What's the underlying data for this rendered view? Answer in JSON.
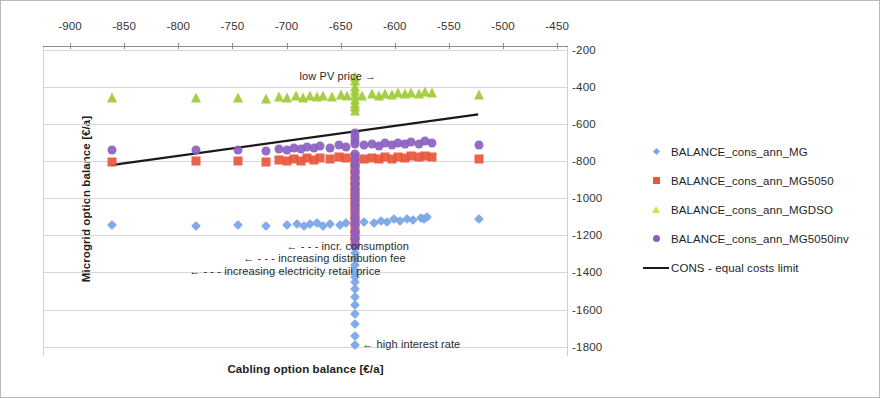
{
  "chart_data": {
    "type": "scatter",
    "title": "",
    "xlabel": "Cabling option balance [€/a]",
    "ylabel": "Microgrid option balance [€/a]",
    "xlim": [
      -925,
      -440
    ],
    "ylim": [
      -1850,
      -180
    ],
    "x_ticks": [
      -900,
      -850,
      -800,
      -750,
      -700,
      -650,
      -600,
      -550,
      -500,
      -450
    ],
    "y_ticks": [
      -200,
      -400,
      -600,
      -800,
      -1000,
      -1200,
      -1400,
      -1600,
      -1800
    ],
    "x_axis_position": "top",
    "y_axis_position": "right",
    "grid": true,
    "legend_position": "right",
    "colors": {
      "BALANCE_cons_ann_MG": "#7ca6e8",
      "BALANCE_cons_ann_MG5050": "#e8563c",
      "BALANCE_cons_ann_MGDSO": "#9ecb36",
      "BALANCE_cons_ann_MG5050inv": "#8b5fbf",
      "CONS - equal costs limit": "#1a1a1a"
    },
    "series": [
      {
        "name": "BALANCE_cons_ann_MG",
        "marker": "diamond",
        "color": "#7ca6e8",
        "points": [
          [
            -861,
            -1146
          ],
          [
            -784,
            -1147
          ],
          [
            -745,
            -1146
          ],
          [
            -719,
            -1150
          ],
          [
            -700,
            -1142
          ],
          [
            -690,
            -1137
          ],
          [
            -684,
            -1150
          ],
          [
            -678,
            -1140
          ],
          [
            -672,
            -1133
          ],
          [
            -666,
            -1147
          ],
          [
            -660,
            -1138
          ],
          [
            -651,
            -1143
          ],
          [
            -645,
            -1136
          ],
          [
            -637,
            -1129
          ],
          [
            -637,
            -1190
          ],
          [
            -637,
            -1222
          ],
          [
            -637,
            -1249
          ],
          [
            -637,
            -1270
          ],
          [
            -637,
            -1296
          ],
          [
            -637,
            -1330
          ],
          [
            -637,
            -1360
          ],
          [
            -637,
            -1391
          ],
          [
            -637,
            -1424
          ],
          [
            -637,
            -1452
          ],
          [
            -637,
            -1490
          ],
          [
            -637,
            -1530
          ],
          [
            -637,
            -1576
          ],
          [
            -637,
            -1625
          ],
          [
            -637,
            -1680
          ],
          [
            -637,
            -1740
          ],
          [
            -637,
            -1790
          ],
          [
            -628,
            -1126
          ],
          [
            -619,
            -1131
          ],
          [
            -613,
            -1122
          ],
          [
            -607,
            -1128
          ],
          [
            -601,
            -1114
          ],
          [
            -595,
            -1122
          ],
          [
            -589,
            -1110
          ],
          [
            -583,
            -1118
          ],
          [
            -576,
            -1104
          ],
          [
            -573,
            -1112
          ],
          [
            -570,
            -1100
          ],
          [
            -522,
            -1112
          ]
        ]
      },
      {
        "name": "BALANCE_cons_ann_MG5050",
        "marker": "square",
        "color": "#e8563c",
        "points": [
          [
            -861,
            -805
          ],
          [
            -784,
            -800
          ],
          [
            -745,
            -800
          ],
          [
            -719,
            -806
          ],
          [
            -707,
            -796
          ],
          [
            -700,
            -801
          ],
          [
            -693,
            -790
          ],
          [
            -687,
            -797
          ],
          [
            -681,
            -786
          ],
          [
            -675,
            -793
          ],
          [
            -669,
            -783
          ],
          [
            -660,
            -789
          ],
          [
            -652,
            -780
          ],
          [
            -645,
            -786
          ],
          [
            -637,
            -776
          ],
          [
            -637,
            -812
          ],
          [
            -637,
            -845
          ],
          [
            -637,
            -876
          ],
          [
            -637,
            -905
          ],
          [
            -637,
            -935
          ],
          [
            -637,
            -965
          ],
          [
            -637,
            -995
          ],
          [
            -637,
            -1025
          ],
          [
            -637,
            -1060
          ],
          [
            -637,
            -1095
          ],
          [
            -637,
            -1130
          ],
          [
            -637,
            -1165
          ],
          [
            -637,
            -1200
          ],
          [
            -637,
            -1235
          ],
          [
            -628,
            -788
          ],
          [
            -621,
            -782
          ],
          [
            -615,
            -791
          ],
          [
            -609,
            -780
          ],
          [
            -603,
            -787
          ],
          [
            -597,
            -776
          ],
          [
            -591,
            -783
          ],
          [
            -585,
            -772
          ],
          [
            -578,
            -780
          ],
          [
            -572,
            -770
          ],
          [
            -566,
            -777
          ],
          [
            -522,
            -790
          ]
        ]
      },
      {
        "name": "BALANCE_cons_ann_MGDSO",
        "marker": "triangle",
        "color": "#9ecb36",
        "points": [
          [
            -861,
            -462
          ],
          [
            -784,
            -462
          ],
          [
            -745,
            -458
          ],
          [
            -719,
            -465
          ],
          [
            -707,
            -455
          ],
          [
            -700,
            -462
          ],
          [
            -691,
            -452
          ],
          [
            -685,
            -460
          ],
          [
            -678,
            -449
          ],
          [
            -672,
            -457
          ],
          [
            -666,
            -447
          ],
          [
            -658,
            -455
          ],
          [
            -650,
            -445
          ],
          [
            -644,
            -452
          ],
          [
            -637,
            -442
          ],
          [
            -637,
            -400
          ],
          [
            -637,
            -370
          ],
          [
            -637,
            -345
          ],
          [
            -637,
            -420
          ],
          [
            -637,
            -470
          ],
          [
            -637,
            -490
          ],
          [
            -637,
            -510
          ],
          [
            -637,
            -530
          ],
          [
            -630,
            -448
          ],
          [
            -621,
            -440
          ],
          [
            -615,
            -447
          ],
          [
            -609,
            -437
          ],
          [
            -603,
            -444
          ],
          [
            -597,
            -434
          ],
          [
            -591,
            -441
          ],
          [
            -585,
            -431
          ],
          [
            -578,
            -438
          ],
          [
            -572,
            -428
          ],
          [
            -566,
            -435
          ],
          [
            -522,
            -445
          ]
        ]
      },
      {
        "name": "BALANCE_cons_ann_MG5050inv",
        "marker": "circle",
        "color": "#8b5fbf",
        "points": [
          [
            -861,
            -742
          ],
          [
            -784,
            -740
          ],
          [
            -745,
            -738
          ],
          [
            -719,
            -745
          ],
          [
            -707,
            -733
          ],
          [
            -700,
            -740
          ],
          [
            -693,
            -728
          ],
          [
            -687,
            -735
          ],
          [
            -681,
            -723
          ],
          [
            -675,
            -731
          ],
          [
            -669,
            -719
          ],
          [
            -660,
            -727
          ],
          [
            -652,
            -715
          ],
          [
            -645,
            -722
          ],
          [
            -637,
            -710
          ],
          [
            -637,
            -650
          ],
          [
            -637,
            -672
          ],
          [
            -637,
            -690
          ],
          [
            -637,
            -760
          ],
          [
            -637,
            -790
          ],
          [
            -637,
            -820
          ],
          [
            -637,
            -855
          ],
          [
            -637,
            -890
          ],
          [
            -637,
            -925
          ],
          [
            -637,
            -960
          ],
          [
            -637,
            -995
          ],
          [
            -637,
            -1030
          ],
          [
            -637,
            -1065
          ],
          [
            -637,
            -1100
          ],
          [
            -637,
            -1140
          ],
          [
            -637,
            -1180
          ],
          [
            -637,
            -1215
          ],
          [
            -637,
            -1250
          ],
          [
            -628,
            -716
          ],
          [
            -621,
            -708
          ],
          [
            -615,
            -717
          ],
          [
            -609,
            -705
          ],
          [
            -603,
            -713
          ],
          [
            -597,
            -701
          ],
          [
            -591,
            -709
          ],
          [
            -585,
            -698
          ],
          [
            -578,
            -706
          ],
          [
            -572,
            -694
          ],
          [
            -566,
            -702
          ],
          [
            -522,
            -712
          ]
        ]
      }
    ],
    "trend_line": {
      "name": "CONS - equal costs limit",
      "color": "#1a1a1a",
      "x": [
        -862,
        -523
      ],
      "y": [
        -822,
        -548
      ]
    },
    "annotations": [
      {
        "id": "low-pv-price",
        "text": "low PV price →",
        "x": -688,
        "y": -345
      },
      {
        "id": "incr-consumption",
        "text": "← - - - incr.    consumption",
        "x": -700,
        "y": -1262
      },
      {
        "id": "increasing-distribution-fee",
        "text": "← - - - increasing distribution fee",
        "x": -740,
        "y": -1330
      },
      {
        "id": "increasing-electricity-retail-price",
        "text": "← - - - increasing electricity retail price",
        "x": -790,
        "y": -1400
      },
      {
        "id": "high-interest-rate",
        "text": "← high interest rate",
        "x": -630,
        "y": -1790
      }
    ]
  },
  "axes": {
    "x_title": "Cabling option balance [€/a]",
    "y_title": "Microgrid option balance [€/a]",
    "x_tick_labels": [
      "-900",
      "-850",
      "-800",
      "-750",
      "-700",
      "-650",
      "-600",
      "-550",
      "-500",
      "-450"
    ],
    "y_tick_labels": [
      "-200",
      "-400",
      "-600",
      "-800",
      "-1000",
      "-1200",
      "-1400",
      "-1600",
      "-1800"
    ]
  },
  "legend": {
    "items": [
      {
        "label": "BALANCE_cons_ann_MG",
        "marker": "diamond",
        "color": "#7ca6e8"
      },
      {
        "label": "BALANCE_cons_ann_MG5050",
        "marker": "square",
        "color": "#e8563c"
      },
      {
        "label": "BALANCE_cons_ann_MGDSO",
        "marker": "triangle",
        "color": "#d6e04a"
      },
      {
        "label": "BALANCE_cons_ann_MG5050inv",
        "marker": "circle",
        "color": "#8b5fbf"
      },
      {
        "label": "CONS - equal costs limit",
        "marker": "line",
        "color": "#1a1a1a"
      }
    ]
  }
}
